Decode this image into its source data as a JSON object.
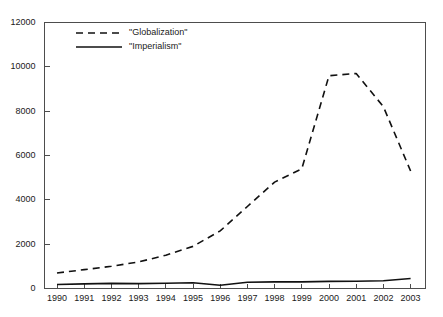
{
  "chart_data": {
    "type": "line",
    "title": "",
    "subtitle": "",
    "xlabel": "",
    "ylabel": "",
    "categories": [
      "1990",
      "1991",
      "1992",
      "1993",
      "1994",
      "1995",
      "1996",
      "1997",
      "1998",
      "1999",
      "2000",
      "2001",
      "2002",
      "2003"
    ],
    "x": [
      1990,
      1991,
      1992,
      1993,
      1994,
      1995,
      1996,
      1997,
      1998,
      1999,
      2000,
      2001,
      2002,
      2003
    ],
    "xlim": [
      1990,
      2003
    ],
    "ylim": [
      0,
      12000
    ],
    "y_ticks": [
      0,
      2000,
      4000,
      6000,
      8000,
      10000,
      12000
    ],
    "y_tick_labels": [
      "0",
      "2000",
      "4000",
      "6000",
      "8000",
      "10000",
      "12000"
    ],
    "grid": false,
    "legend_position": "top-left-inside",
    "series": [
      {
        "name": "\"Globalization\"",
        "style": "dashed",
        "color": "#111111",
        "values": [
          700,
          850,
          1000,
          1200,
          1500,
          1900,
          2600,
          3700,
          4800,
          5400,
          9600,
          9700,
          8200,
          5300
        ]
      },
      {
        "name": "\"Imperialism\"",
        "style": "solid",
        "color": "#111111",
        "values": [
          180,
          210,
          230,
          220,
          240,
          260,
          150,
          280,
          300,
          300,
          320,
          330,
          350,
          450
        ]
      }
    ]
  },
  "legend": {
    "entries": [
      {
        "label": "\"Globalization\"",
        "style": "dashed"
      },
      {
        "label": "\"Imperialism\"",
        "style": "solid"
      }
    ]
  },
  "axes": {
    "y_axis_name": "value-axis",
    "x_axis_name": "year-axis"
  }
}
